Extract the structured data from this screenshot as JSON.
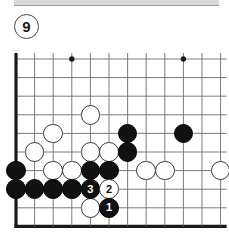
{
  "figure": {
    "number": "9",
    "type": "go-board-diagram",
    "colors": {
      "black_stone": "#111111",
      "white_stone": "#ffffff",
      "grid_line": "#6d6d6d",
      "border_line": "#1a1a1a",
      "background": "#ffffff",
      "badge_border": "#4a4a4a"
    }
  },
  "board": {
    "columns": 12,
    "rows": 10,
    "spacing": 18.6,
    "origin_x": 16,
    "origin_y": 19,
    "left_edge_thick": true,
    "bottom_edge_thick": true,
    "star_points": [
      {
        "col": 4,
        "row": 1
      },
      {
        "col": 10,
        "row": 1
      }
    ],
    "stones": [
      {
        "col": 5,
        "row": 4,
        "color": "white",
        "label": ""
      },
      {
        "col": 3,
        "row": 5,
        "color": "white",
        "label": ""
      },
      {
        "col": 7,
        "row": 5,
        "color": "black",
        "label": ""
      },
      {
        "col": 10,
        "row": 5,
        "color": "black",
        "label": ""
      },
      {
        "col": 2,
        "row": 6,
        "color": "white",
        "label": ""
      },
      {
        "col": 5,
        "row": 6,
        "color": "white",
        "label": ""
      },
      {
        "col": 6,
        "row": 6,
        "color": "white",
        "label": ""
      },
      {
        "col": 7,
        "row": 6,
        "color": "black",
        "label": ""
      },
      {
        "col": 1,
        "row": 7,
        "color": "black",
        "label": ""
      },
      {
        "col": 3,
        "row": 7,
        "color": "white",
        "label": ""
      },
      {
        "col": 4,
        "row": 7,
        "color": "white",
        "label": ""
      },
      {
        "col": 5,
        "row": 7,
        "color": "black",
        "label": ""
      },
      {
        "col": 6,
        "row": 7,
        "color": "black",
        "label": ""
      },
      {
        "col": 8,
        "row": 7,
        "color": "white",
        "label": ""
      },
      {
        "col": 9,
        "row": 7,
        "color": "white",
        "label": ""
      },
      {
        "col": 12,
        "row": 7,
        "color": "white",
        "label": ""
      },
      {
        "col": 1,
        "row": 8,
        "color": "black",
        "label": ""
      },
      {
        "col": 2,
        "row": 8,
        "color": "black",
        "label": ""
      },
      {
        "col": 3,
        "row": 8,
        "color": "black",
        "label": ""
      },
      {
        "col": 4,
        "row": 8,
        "color": "black",
        "label": ""
      },
      {
        "col": 5,
        "row": 8,
        "color": "black",
        "label": "3"
      },
      {
        "col": 6,
        "row": 8,
        "color": "white",
        "label": "2"
      },
      {
        "col": 5,
        "row": 9,
        "color": "white",
        "label": ""
      },
      {
        "col": 6,
        "row": 9,
        "color": "black",
        "label": "1"
      }
    ],
    "move_sequence": [
      {
        "label": "1",
        "color": "black",
        "col": 6,
        "row": 9
      },
      {
        "label": "2",
        "color": "white",
        "col": 6,
        "row": 8
      },
      {
        "label": "3",
        "color": "black",
        "col": 5,
        "row": 8
      }
    ]
  }
}
